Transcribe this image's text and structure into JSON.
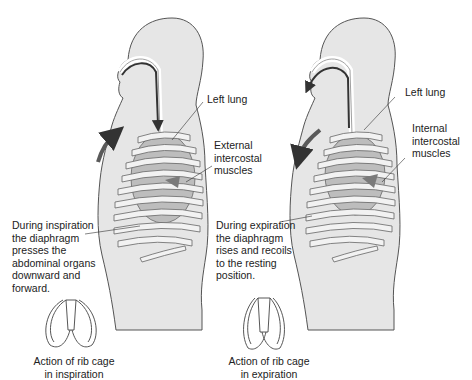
{
  "panels": [
    {
      "name": "inspiration",
      "labels": {
        "lung": "Left lung",
        "muscles": "External\nintercostal\nmuscles",
        "diaphragm": "During inspiration\nthe diaphragm\npresses the\nabdominal organs\ndownward and\nforward.",
        "rib_caption": "Action of rib cage\nin inspiration"
      },
      "airflow": "inward",
      "chest_arrow": "upward"
    },
    {
      "name": "expiration",
      "labels": {
        "lung": "Left lung",
        "muscles": "Internal\nintercostal\nmuscles",
        "diaphragm": "During expiration\nthe diaphragm\nrises and recoils\nto the resting\nposition.",
        "rib_caption": "Action of rib cage\nin expiration"
      },
      "airflow": "outward",
      "chest_arrow": "downward"
    }
  ],
  "colors": {
    "skin": "#e6e6e6",
    "outline": "#555555",
    "rib": "#f2f2f2",
    "lung": "#bdbdbd",
    "muscle": "#7a7a7a",
    "arrow": "#5a5a5a"
  }
}
